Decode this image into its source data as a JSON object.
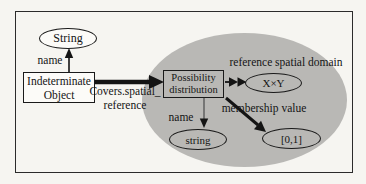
{
  "diagram": {
    "colors": {
      "page_background": "#f6f5f1",
      "frame_border": "#2b2b2b",
      "region_fill": "#b9b8b5",
      "node_fill": "#fcfbf8",
      "node_border": "#1a1a1a",
      "text": "#141414",
      "arrow": "#141414",
      "thin_edge": "#5a5a5a"
    },
    "nodes": {
      "string_class": {
        "label": "String"
      },
      "indeterminate_object": {
        "line1": "Indeterminate",
        "line2": "Object"
      },
      "possibility_distribution": {
        "line1": "Possibility",
        "line2": "distribution"
      },
      "spatial_domain": {
        "label": "X×Y"
      },
      "name_type": {
        "label": "string"
      },
      "unit_interval": {
        "label": "[0,1]"
      }
    },
    "edges": {
      "name_top": {
        "label": "name"
      },
      "covers_spatial_reference": {
        "line1": "Covers.spatial_",
        "line2": "reference"
      },
      "reference_spatial_domain": {
        "label": "reference spatial domain"
      },
      "name_bottom": {
        "label": "name"
      },
      "membership_value": {
        "label": "membership value"
      }
    }
  }
}
